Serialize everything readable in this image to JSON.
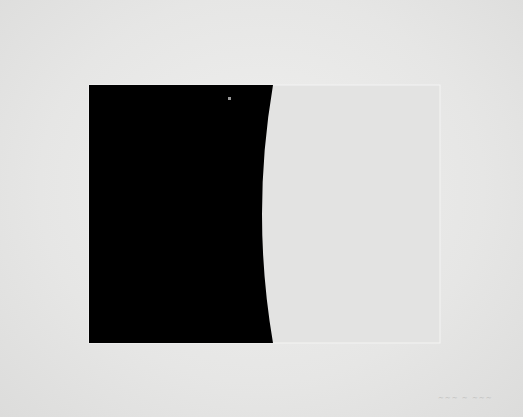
{
  "image": {
    "description": "Photograph of a minimalist print: a black rectangle with a concave curved right edge beside a pale embossed rectangle on white paper",
    "colors": {
      "paper": "#e8e8e7",
      "black_field": "#000000",
      "light_panel": "#e4e4e3",
      "panel_edge": "#f6f6f5"
    },
    "signature": "~~~ ~ ~~~"
  }
}
